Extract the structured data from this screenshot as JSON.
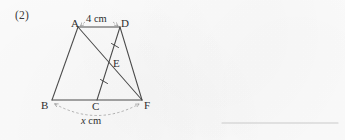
{
  "page": {
    "background_color": "#fcfcfc",
    "ink_color": "#3a3a3a",
    "width": 345,
    "height": 140
  },
  "question": {
    "number_label": "(2)",
    "answer_blank": {
      "name": "answer-line",
      "visible": true,
      "color": "#c9c9c9"
    }
  },
  "figure": {
    "type": "geometry-diagram",
    "vertices": [
      {
        "id": "A",
        "label": "A",
        "x": 78,
        "y": 27
      },
      {
        "id": "D",
        "label": "D",
        "x": 120,
        "y": 27
      },
      {
        "id": "E",
        "label": "E",
        "x": 110,
        "y": 66
      },
      {
        "id": "B",
        "label": "B",
        "x": 52,
        "y": 100
      },
      {
        "id": "C",
        "label": "C",
        "x": 97,
        "y": 100
      },
      {
        "id": "F",
        "label": "F",
        "x": 142,
        "y": 100
      }
    ],
    "segments": [
      {
        "id": "AD",
        "from": "A",
        "to": "D"
      },
      {
        "id": "AB",
        "from": "A",
        "to": "B"
      },
      {
        "id": "DF",
        "from": "D",
        "to": "F"
      },
      {
        "id": "BF",
        "from": "B",
        "to": "F"
      },
      {
        "id": "AF",
        "from": "A",
        "to": "F"
      },
      {
        "id": "CD",
        "from": "C",
        "to": "D"
      }
    ],
    "tick_marks": [
      {
        "id": "tick-DE",
        "on_segment": "DE",
        "count": 1
      },
      {
        "id": "tick-CE",
        "on_segment": "CE",
        "count": 1
      }
    ],
    "measurements": [
      {
        "id": "top-measure",
        "value": "4 cm",
        "between": [
          "A",
          "D"
        ],
        "style": "dashed-double-arrow",
        "position": "above"
      },
      {
        "id": "bottom-measure",
        "value_var": "x",
        "value_unit": "cm",
        "between": [
          "B",
          "F"
        ],
        "style": "dashed-arc-double-arrow",
        "position": "below"
      }
    ]
  }
}
